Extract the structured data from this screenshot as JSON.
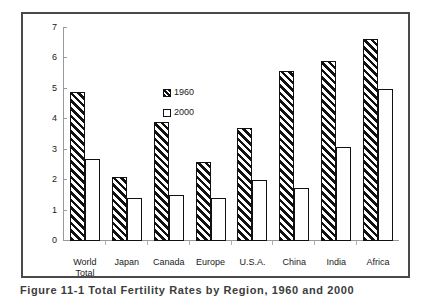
{
  "chart_data": {
    "type": "bar",
    "title": "",
    "xlabel": "",
    "ylabel": "",
    "ylim": [
      0,
      7
    ],
    "yticks": [
      0,
      1,
      2,
      3,
      4,
      5,
      6,
      7
    ],
    "grid": false,
    "legend_position": "inside-upper-left",
    "categories": [
      "World Total",
      "Japan",
      "Canada",
      "Europe",
      "U.S.A.",
      "China",
      "India",
      "Africa"
    ],
    "category_lines": [
      [
        "World",
        "Total"
      ],
      [
        "Japan"
      ],
      [
        "Canada"
      ],
      [
        "Europe"
      ],
      [
        "U.S.A."
      ],
      [
        "China"
      ],
      [
        "India"
      ],
      [
        "Africa"
      ]
    ],
    "series": [
      {
        "name": "1960",
        "fill": "diagonal-hatch",
        "values": [
          4.9,
          2.1,
          3.9,
          2.6,
          3.7,
          5.6,
          5.9,
          6.65
        ]
      },
      {
        "name": "2000",
        "fill": "white",
        "values": [
          2.7,
          1.4,
          1.5,
          1.4,
          2.0,
          1.75,
          3.1,
          5.0
        ]
      }
    ]
  },
  "figure": {
    "caption": "Figure 11-1 Total Fertility Rates by Region, 1960 and 2000"
  },
  "colors": {
    "frame": "#4a4a4a",
    "axis": "#9a9a9a",
    "bar_outline": "#111111",
    "hatch": "#111111",
    "background": "#ffffff",
    "text": "#1a1a1a"
  }
}
